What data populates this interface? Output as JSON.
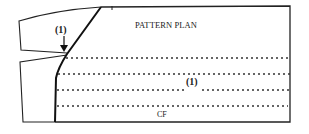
{
  "diagram": {
    "title": "PATTERN PLAN",
    "labels": {
      "marker_top": "(1)",
      "marker_middle": "(1)",
      "center_front": "CF"
    },
    "dotted_line_count": 4,
    "colors": {
      "line": "#222222",
      "background": "#ffffff"
    }
  }
}
